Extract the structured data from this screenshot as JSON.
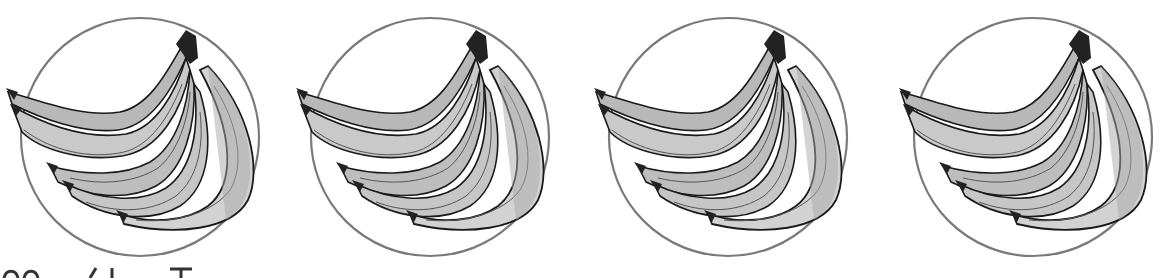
{
  "figure": {
    "panel_count": 4,
    "panels": [
      {
        "icon": "banana-bunch-icon",
        "offset_x": 0
      },
      {
        "icon": "banana-bunch-icon",
        "offset_x": 290
      },
      {
        "icon": "banana-bunch-icon",
        "offset_x": 588
      },
      {
        "icon": "banana-bunch-icon",
        "offset_x": 893
      }
    ],
    "colors": {
      "circle_stroke": "#7a7a7a",
      "banana_light": "#cfcfcf",
      "banana_mid": "#a9a9a9",
      "outline": "#1a1a1a",
      "stem": "#222222"
    }
  }
}
